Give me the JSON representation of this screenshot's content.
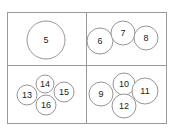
{
  "diagram": {
    "frame": {
      "x": 7.5,
      "y": 12.5,
      "width": 159,
      "height": 111,
      "divider_x": 86.5,
      "divider_y": 65.5
    },
    "colors": {
      "line": "#9a9a9a",
      "circle_stroke": "#8a8a8a",
      "text": "#222222",
      "background": "#ffffff"
    },
    "panels": [
      {
        "name": "top-left",
        "circles": [
          {
            "label": "5",
            "cx": 46,
            "cy": 40,
            "r": 19
          }
        ]
      },
      {
        "name": "top-right",
        "circles": [
          {
            "label": "6",
            "cx": 100,
            "cy": 41,
            "r": 13
          },
          {
            "label": "7",
            "cx": 123,
            "cy": 33,
            "r": 12
          },
          {
            "label": "8",
            "cx": 146,
            "cy": 38,
            "r": 12
          }
        ]
      },
      {
        "name": "bottom-left",
        "circles": [
          {
            "label": "13",
            "cx": 27,
            "cy": 95,
            "r": 10
          },
          {
            "label": "14",
            "cx": 45,
            "cy": 84,
            "r": 9
          },
          {
            "label": "15",
            "cx": 64,
            "cy": 92,
            "r": 10
          },
          {
            "label": "16",
            "cx": 46,
            "cy": 105,
            "r": 10
          }
        ]
      },
      {
        "name": "bottom-right",
        "circles": [
          {
            "label": "9",
            "cx": 101,
            "cy": 94,
            "r": 12
          },
          {
            "label": "10",
            "cx": 124,
            "cy": 84,
            "r": 11
          },
          {
            "label": "11",
            "cx": 145,
            "cy": 91,
            "r": 13
          },
          {
            "label": "12",
            "cx": 124,
            "cy": 106,
            "r": 12
          }
        ]
      }
    ]
  }
}
